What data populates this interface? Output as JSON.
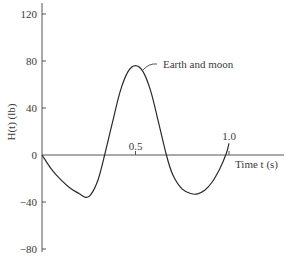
{
  "chart_data": {
    "type": "line",
    "title": "",
    "xlabel": "Time t (s)",
    "ylabel": "H(t) (lb)",
    "xlim": [
      0,
      1.25
    ],
    "ylim": [
      -80,
      120
    ],
    "grid": false,
    "x_ticks": [
      {
        "value": 0.5,
        "label": "0.5"
      },
      {
        "value": 1.0,
        "label": "1.0"
      }
    ],
    "y_ticks": [
      {
        "value": 120,
        "label": "120"
      },
      {
        "value": 80,
        "label": "80"
      },
      {
        "value": 40,
        "label": "40"
      },
      {
        "value": 0,
        "label": "0"
      },
      {
        "value": -40,
        "label": "-40"
      },
      {
        "value": -80,
        "label": "-80"
      }
    ],
    "series": [
      {
        "name": "Earth and moon",
        "x": [
          0,
          0.05,
          0.1,
          0.15,
          0.2,
          0.232,
          0.26,
          0.3,
          0.335,
          0.38,
          0.42,
          0.46,
          0.5,
          0.54,
          0.58,
          0.62,
          0.665,
          0.7,
          0.75,
          0.8,
          0.832,
          0.87,
          0.91,
          0.95,
          0.985,
          1.0
        ],
        "values": [
          0,
          -12,
          -21,
          -28,
          -33,
          -36,
          -34,
          -21,
          0,
          30,
          55,
          71,
          76,
          71,
          55,
          30,
          0,
          -17,
          -29,
          -33,
          -33,
          -30,
          -23,
          -12,
          1,
          10
        ]
      }
    ],
    "annotations": [
      {
        "text": "Earth and moon",
        "x": 0.52,
        "y": 76
      },
      {
        "text": "1.0",
        "x": 1.0,
        "y": 10
      }
    ]
  },
  "axes": {
    "x_axis_label": "Time t (s)",
    "y_axis_label": "H(t) (lb)"
  },
  "labels": {
    "curve_label": "Earth and moon"
  }
}
